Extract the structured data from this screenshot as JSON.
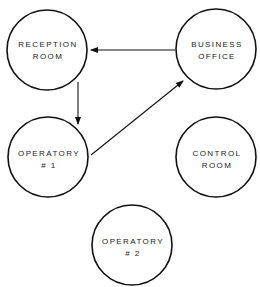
{
  "diagram": {
    "type": "flow",
    "colors": {
      "stroke": "#111111",
      "text": "#222222",
      "background": "#ffffff"
    },
    "nodes": [
      {
        "id": "reception",
        "line1": "RECEPTION",
        "line2": "ROOM",
        "cx": 47,
        "cy": 50,
        "r": 40
      },
      {
        "id": "business",
        "line1": "BUSINESS",
        "line2": "OFFICE",
        "cx": 216,
        "cy": 49,
        "r": 40
      },
      {
        "id": "operatory1",
        "line1": "OPERATORY",
        "line2": "# 1",
        "cx": 48,
        "cy": 157,
        "r": 40
      },
      {
        "id": "control",
        "line1": "CONTROL",
        "line2": "ROOM",
        "cx": 216,
        "cy": 157,
        "r": 40
      },
      {
        "id": "operatory2",
        "line1": "OPERATORY",
        "line2": "# 2",
        "cx": 132,
        "cy": 245,
        "r": 40
      }
    ],
    "edges": [
      {
        "from": "business",
        "to": "reception"
      },
      {
        "from": "reception",
        "to": "operatory1"
      },
      {
        "from": "operatory1",
        "to": "business"
      }
    ]
  }
}
